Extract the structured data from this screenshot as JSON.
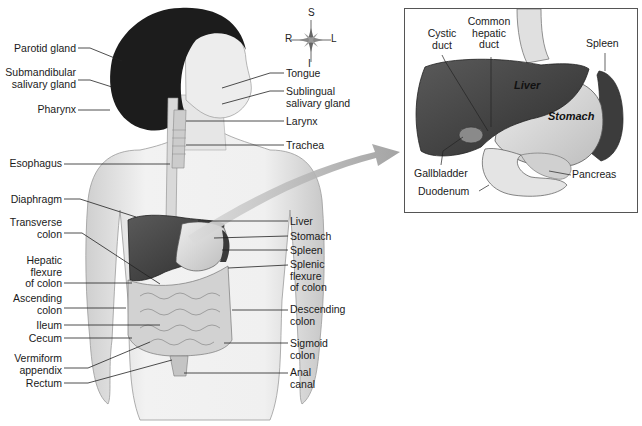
{
  "figure": {
    "compass": {
      "superior": "S",
      "inferior": "I",
      "right": "R",
      "left": "L"
    },
    "left_labels": [
      {
        "id": "parotid-gland",
        "text": "Parotid gland",
        "x": 10,
        "y": 44
      },
      {
        "id": "submandibular-salivary-gland",
        "text": "Submandibular\nsalivary gland",
        "x": 4,
        "y": 67
      },
      {
        "id": "pharynx",
        "text": "Pharynx",
        "x": 36,
        "y": 105
      },
      {
        "id": "esophagus",
        "text": "Esophagus",
        "x": 6,
        "y": 159
      },
      {
        "id": "diaphragm",
        "text": "Diaphragm",
        "x": 6,
        "y": 195
      },
      {
        "id": "transverse-colon",
        "text": "Transverse\ncolon",
        "x": 8,
        "y": 218
      },
      {
        "id": "hepatic-flexure-of-colon",
        "text": "Hepatic\nflexure\nof colon",
        "x": 22,
        "y": 252
      },
      {
        "id": "ascending-colon",
        "text": "Ascending\ncolon",
        "x": 10,
        "y": 293
      },
      {
        "id": "ileum",
        "text": "Ileum",
        "x": 34,
        "y": 320
      },
      {
        "id": "cecum",
        "text": "Cecum",
        "x": 28,
        "y": 333
      },
      {
        "id": "vermiform-appendix",
        "text": "Vermiform\nappendix",
        "x": 12,
        "y": 353
      },
      {
        "id": "rectum",
        "text": "Rectum",
        "x": 26,
        "y": 378
      }
    ],
    "right_labels": [
      {
        "id": "tongue",
        "text": "Tongue",
        "x": 284,
        "y": 68
      },
      {
        "id": "sublingual-salivary-gland",
        "text": "Sublingual\nsalivary gland",
        "x": 284,
        "y": 86
      },
      {
        "id": "larynx",
        "text": "Larynx",
        "x": 284,
        "y": 116
      },
      {
        "id": "trachea",
        "text": "Trachea",
        "x": 284,
        "y": 140
      },
      {
        "id": "liver",
        "text": "Liver",
        "x": 290,
        "y": 216
      },
      {
        "id": "stomach",
        "text": "Stomach",
        "x": 290,
        "y": 231
      },
      {
        "id": "spleen",
        "text": "Spleen",
        "x": 290,
        "y": 245
      },
      {
        "id": "splenic-flexure-of-colon",
        "text": "Splenic\nflexure\nof colon",
        "x": 290,
        "y": 259
      },
      {
        "id": "descending-colon",
        "text": "Descending\ncolon",
        "x": 290,
        "y": 303
      },
      {
        "id": "sigmoid-colon",
        "text": "Sigmoid\ncolon",
        "x": 290,
        "y": 338
      },
      {
        "id": "anal-canal",
        "text": "Anal\ncanal",
        "x": 290,
        "y": 367
      }
    ],
    "inset": {
      "title": "Liver, stomach, gallbladder and pancreas detail",
      "labels": [
        {
          "id": "cystic-duct",
          "text": "Cystic\nduct",
          "x": 425,
          "y": 28,
          "align": "center"
        },
        {
          "id": "common-hepatic-duct",
          "text": "Common\nhepatic\nduct",
          "x": 468,
          "y": 16,
          "align": "center"
        },
        {
          "id": "spleen",
          "text": "Spleen",
          "x": 585,
          "y": 38,
          "align": "left"
        },
        {
          "id": "gallbladder",
          "text": "Gallbladder",
          "x": 414,
          "y": 168,
          "align": "left"
        },
        {
          "id": "duodenum",
          "text": "Duodenum",
          "x": 418,
          "y": 186,
          "align": "left"
        },
        {
          "id": "pancreas",
          "text": "Pancreas",
          "x": 571,
          "y": 169,
          "align": "left"
        }
      ],
      "organ_labels": [
        {
          "id": "liver",
          "text": "Liver",
          "x": 514,
          "y": 80
        },
        {
          "id": "stomach",
          "text": "Stomach",
          "x": 548,
          "y": 111
        }
      ]
    },
    "colors": {
      "skin_light": "#ececec",
      "skin_shadow": "#c9c9c9",
      "hair": "#1c1c1c",
      "liver": "#4a4a4a",
      "stomach": "#d8d8d8",
      "spleen": "#3a3a3a",
      "intestine": "#cfcfcf",
      "leader_line": "#222222",
      "arrow": "#9a9a9a"
    }
  }
}
